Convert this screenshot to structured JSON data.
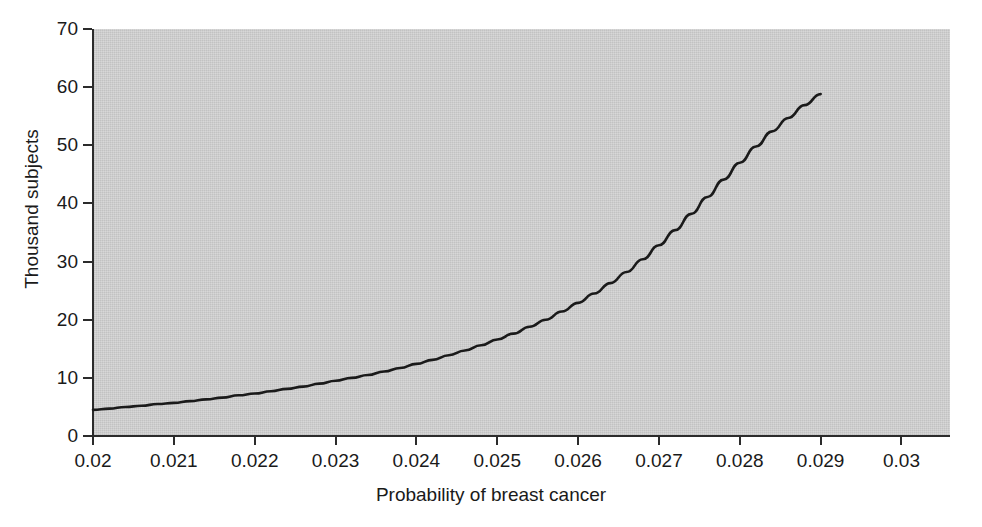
{
  "chart_data": {
    "type": "line",
    "title": "",
    "xlabel": "Probability of breast cancer",
    "ylabel": "Thousand subjects",
    "xlim": [
      0.02,
      0.0306
    ],
    "ylim": [
      0,
      70
    ],
    "grid": false,
    "legend": null,
    "x_ticks": [
      "0.02",
      "0.021",
      "0.022",
      "0.023",
      "0.024",
      "0.025",
      "0.026",
      "0.027",
      "0.028",
      "0.029",
      "0.03"
    ],
    "x_tick_values": [
      0.02,
      0.021,
      0.022,
      0.023,
      0.024,
      0.025,
      0.026,
      0.027,
      0.028,
      0.029,
      0.03
    ],
    "y_ticks": [
      "0",
      "10",
      "20",
      "30",
      "40",
      "50",
      "60",
      "70"
    ],
    "y_tick_values": [
      0,
      10,
      20,
      30,
      40,
      50,
      60,
      70
    ],
    "series": [
      {
        "name": "Required sample size",
        "color": "#1a1a1a",
        "line_width": 2.6,
        "x": [
          0.02,
          0.0202,
          0.0204,
          0.0206,
          0.0208,
          0.021,
          0.0212,
          0.0214,
          0.0216,
          0.0218,
          0.022,
          0.0222,
          0.0224,
          0.0226,
          0.0228,
          0.023,
          0.0232,
          0.0234,
          0.0236,
          0.0238,
          0.024,
          0.0242,
          0.0244,
          0.0246,
          0.0248,
          0.025,
          0.0252,
          0.0254,
          0.0256,
          0.0258,
          0.026,
          0.0262,
          0.0264,
          0.0266,
          0.0268,
          0.027,
          0.0272,
          0.0274,
          0.0276,
          0.0278,
          0.028,
          0.0282,
          0.0284,
          0.0286,
          0.0288,
          0.029
        ],
        "y": [
          4.5,
          4.7,
          5.0,
          5.2,
          5.5,
          5.7,
          6.0,
          6.3,
          6.6,
          7.0,
          7.3,
          7.7,
          8.1,
          8.5,
          9.0,
          9.5,
          10.0,
          10.5,
          11.1,
          11.7,
          12.4,
          13.1,
          13.9,
          14.7,
          15.6,
          16.6,
          17.6,
          18.8,
          20.0,
          21.4,
          22.9,
          24.5,
          26.3,
          28.2,
          30.4,
          32.8,
          35.4,
          38.2,
          41.1,
          44.1,
          47.0,
          49.8,
          52.4,
          54.7,
          56.9,
          58.8
        ]
      }
    ]
  },
  "axes": {
    "x_title": "Probability of breast cancer",
    "y_title": "Thousand subjects"
  }
}
